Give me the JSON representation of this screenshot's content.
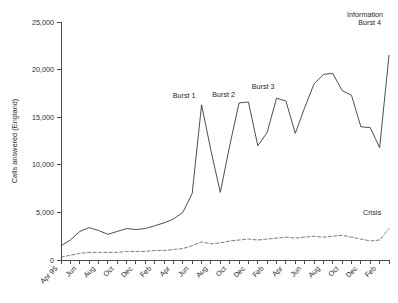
{
  "chart_data": {
    "type": "line",
    "title": "",
    "xlabel": "",
    "ylabel": "Calls answered (England)",
    "ylim": [
      0,
      25000
    ],
    "yticks": [
      0,
      5000,
      10000,
      15000,
      20000,
      25000
    ],
    "ytick_labels": [
      "0",
      "5,000",
      "10,000",
      "15,000",
      "20,000",
      "25,000"
    ],
    "grid": false,
    "legend_position": "inline-annotation",
    "x": [
      "Apr 95",
      "May 95",
      "Jun 95",
      "Jul 95",
      "Aug 95",
      "Sep 95",
      "Oct 95",
      "Nov 95",
      "Dec 95",
      "Jan 96",
      "Feb 96",
      "Mar 96",
      "Apr 96",
      "May 96",
      "Jun 96",
      "Jul 96",
      "Aug 96",
      "Sep 96",
      "Oct 96",
      "Nov 96",
      "Dec 96",
      "Jan 97",
      "Feb 97",
      "Mar 97",
      "Apr 97",
      "May 97",
      "Jun 97",
      "Jul 97",
      "Aug 97",
      "Sep 97",
      "Oct 97",
      "Nov 97",
      "Dec 97",
      "Jan 98",
      "Feb 98",
      "Mar 98"
    ],
    "xtick_labels": [
      "Apr 95",
      "Jun",
      "Aug",
      "Oct",
      "Dec",
      "Feb",
      "Apr",
      "Jun",
      "Aug",
      "Oct",
      "Dec",
      "Feb",
      "Apr",
      "Jun",
      "Aug",
      "Oct",
      "Dec",
      "Feb"
    ],
    "xtick_label_step": 2,
    "series": [
      {
        "name": "Information",
        "style": "solid",
        "color": "#3a3a3a",
        "values": [
          1500,
          2100,
          3000,
          3400,
          3100,
          2700,
          3000,
          3300,
          3200,
          3300,
          3600,
          3900,
          4300,
          5000,
          7000,
          16300,
          11500,
          7100,
          12000,
          16500,
          16600,
          12000,
          13400,
          17000,
          16700,
          13300,
          16000,
          18500,
          19500,
          19600,
          17800,
          17300,
          14000,
          13900,
          11800,
          21500
        ]
      },
      {
        "name": "Crisis",
        "style": "dashed",
        "color": "#6e6e6e",
        "values": [
          300,
          500,
          700,
          800,
          800,
          800,
          800,
          900,
          900,
          900,
          1000,
          1000,
          1100,
          1200,
          1500,
          1900,
          1700,
          1800,
          2000,
          2100,
          2200,
          2100,
          2200,
          2300,
          2400,
          2300,
          2400,
          2500,
          2400,
          2500,
          2600,
          2400,
          2200,
          2000,
          2100,
          3300
        ]
      }
    ],
    "annotations": [
      {
        "label": "Burst 1",
        "at_x": "Jul 96",
        "value": 16300
      },
      {
        "label": "Burst 2",
        "at_x": "Nov 96",
        "value": 16500
      },
      {
        "label": "Burst 3",
        "at_x": "Mar 97",
        "value": 17000
      },
      {
        "label": "Burst 4",
        "at_x": "Mar 98",
        "value": 21500
      },
      {
        "label": "Information",
        "series": "Information"
      },
      {
        "label": "Crisis",
        "series": "Crisis"
      }
    ]
  }
}
